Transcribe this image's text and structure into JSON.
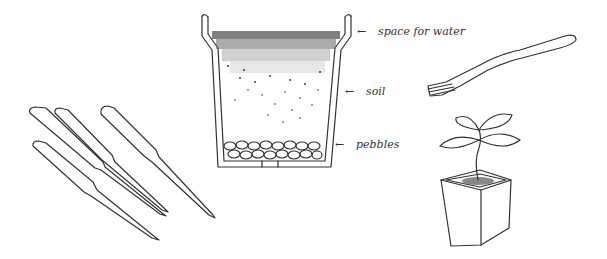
{
  "figure": {
    "ink_color": "#333333",
    "background": "#ffffff"
  },
  "pot_cross_section": {
    "labels": [
      {
        "text": "space for water",
        "arrow": "←"
      },
      {
        "text": "soil",
        "arrow": "←"
      },
      {
        "text": "pebbles",
        "arrow": "←"
      }
    ]
  },
  "objects": [
    {
      "name": "plant-markers",
      "count": 4
    },
    {
      "name": "pot-cross-section"
    },
    {
      "name": "fork"
    },
    {
      "name": "seedling-in-square-pot"
    }
  ]
}
